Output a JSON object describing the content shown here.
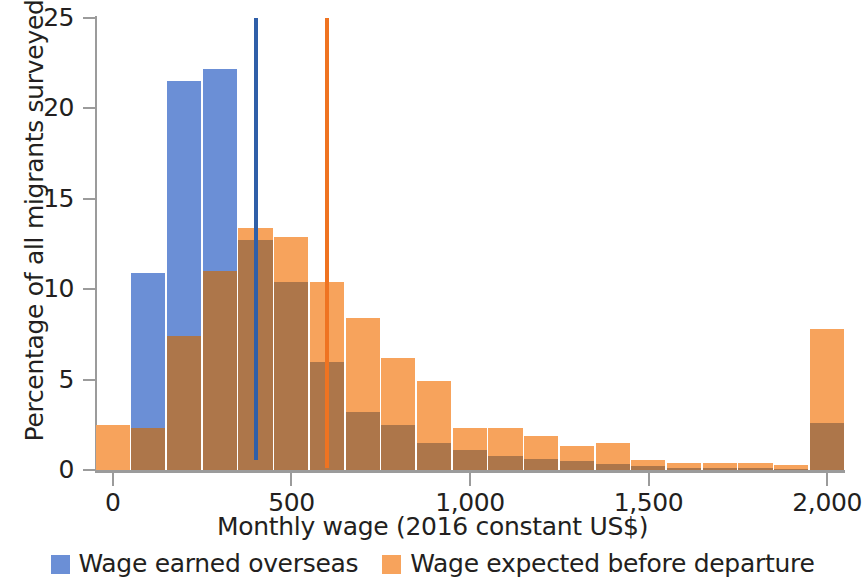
{
  "chart_data": {
    "type": "bar",
    "subtype": "overlaid-histogram",
    "title": "",
    "xlabel": "Monthly wage (2016 constant US$)",
    "ylabel": "Percentage of all migrants surveyed",
    "xlim": [
      -50,
      2050
    ],
    "ylim": [
      0,
      25
    ],
    "xticks": [
      0,
      500,
      1000,
      1500,
      2000
    ],
    "xtick_labels": [
      "0",
      "500",
      "1,000",
      "1,500",
      "2,000"
    ],
    "yticks": [
      0,
      5,
      10,
      15,
      20,
      25
    ],
    "ytick_labels": [
      "0",
      "5",
      "10",
      "15",
      "20",
      "25"
    ],
    "grid": false,
    "legend_position": "bottom",
    "bin_width": 100,
    "bin_starts": [
      -50,
      50,
      150,
      250,
      350,
      450,
      550,
      650,
      750,
      850,
      950,
      1050,
      1150,
      1250,
      1350,
      1450,
      1550,
      1650,
      1750,
      1850,
      1950
    ],
    "bin_centers": [
      0,
      100,
      200,
      300,
      400,
      500,
      600,
      700,
      800,
      900,
      1000,
      1100,
      1200,
      1300,
      1400,
      1500,
      1600,
      1700,
      1800,
      1900,
      2000
    ],
    "series": [
      {
        "name": "Wage earned overseas",
        "color": "#6b8fd6",
        "values": [
          0,
          10.9,
          21.5,
          22.2,
          12.7,
          10.4,
          6.0,
          3.2,
          2.5,
          1.5,
          1.1,
          0.8,
          0.6,
          0.5,
          0.35,
          0.2,
          0.1,
          0.1,
          0.1,
          0.05,
          2.6
        ]
      },
      {
        "name": "Wage expected before departure",
        "color": "#f7a35c",
        "values": [
          2.5,
          2.35,
          7.4,
          11.0,
          13.4,
          12.9,
          10.4,
          8.4,
          6.2,
          4.9,
          2.3,
          2.35,
          1.9,
          1.35,
          1.5,
          0.55,
          0.4,
          0.4,
          0.4,
          0.25,
          7.8
        ]
      }
    ],
    "overlap_color": "#ad764a",
    "annotations": [
      {
        "name": "median-wage-earned-overseas",
        "type": "vline",
        "x": 400,
        "y_top": 25,
        "y_bottom": 0.55,
        "color": "#2f5fa8"
      },
      {
        "name": "median-wage-expected-before-departure",
        "type": "vline",
        "x": 600,
        "y_top": 25,
        "y_bottom": 0.1,
        "color": "#ef7321"
      }
    ]
  },
  "axes": {
    "y_title": "Percentage of all migrants surveyed",
    "x_title": "Monthly wage (2016 constant US$)"
  },
  "legend": {
    "items": [
      {
        "label": "Wage earned overseas",
        "color": "#6b8fd6"
      },
      {
        "label": "Wage expected before departure",
        "color": "#f7a35c"
      }
    ]
  }
}
